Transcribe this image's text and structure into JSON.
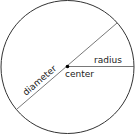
{
  "diagram": {
    "labels": {
      "radius": "radius",
      "center": "center",
      "diameter": "diameter"
    },
    "colors": {
      "circle": "#333333",
      "lines": "#555555",
      "center_dot": "#000000",
      "text": "#222222",
      "background": "#ffffff"
    }
  }
}
